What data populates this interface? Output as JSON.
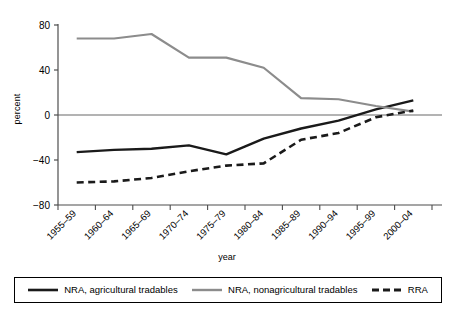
{
  "header": {
    "cut_off_text": "",
    "ylabel": "percent",
    "xlabel": "year"
  },
  "legend": {
    "items": [
      {
        "label": "NRA, agricultural tradables",
        "style": "solid",
        "color": "#1a1a1a",
        "width": 2.4
      },
      {
        "label": "NRA, nonagricultural tradables",
        "style": "solid",
        "color": "#8c8c8c",
        "width": 2.2
      },
      {
        "label": "RRA",
        "style": "dashed",
        "color": "#1a1a1a",
        "width": 2.6
      }
    ]
  },
  "chart_data": {
    "type": "line",
    "title": "",
    "xlabel": "year",
    "ylabel": "percent",
    "ylim": [
      -80,
      80
    ],
    "yticks": [
      80,
      40,
      0,
      -40,
      -80
    ],
    "ytick_labels": [
      "80",
      "40",
      "0",
      "−40",
      "−80"
    ],
    "grid": false,
    "zero_line": true,
    "legend_position": "bottom",
    "categories": [
      "1955–59",
      "1960–64",
      "1965–69",
      "1970–74",
      "1975–79",
      "1980–84",
      "1985–89",
      "1990–94",
      "1995–99",
      "2000–04"
    ],
    "series": [
      {
        "name": "NRA, agricultural tradables",
        "color": "#1a1a1a",
        "dash": "none",
        "width": 2.4,
        "values": [
          -33,
          -31,
          -30,
          -27,
          -35,
          -21,
          -12,
          -5,
          5,
          13
        ]
      },
      {
        "name": "NRA, nonagricultural tradables",
        "color": "#8c8c8c",
        "dash": "none",
        "width": 2.2,
        "values": [
          68,
          68,
          72,
          51,
          51,
          42,
          15,
          14,
          8,
          3
        ]
      },
      {
        "name": "RRA",
        "color": "#1a1a1a",
        "dash": "dashed",
        "width": 2.6,
        "values": [
          -60,
          -59,
          -56,
          -50,
          -45,
          -43,
          -22,
          -16,
          -2,
          4
        ]
      }
    ]
  }
}
